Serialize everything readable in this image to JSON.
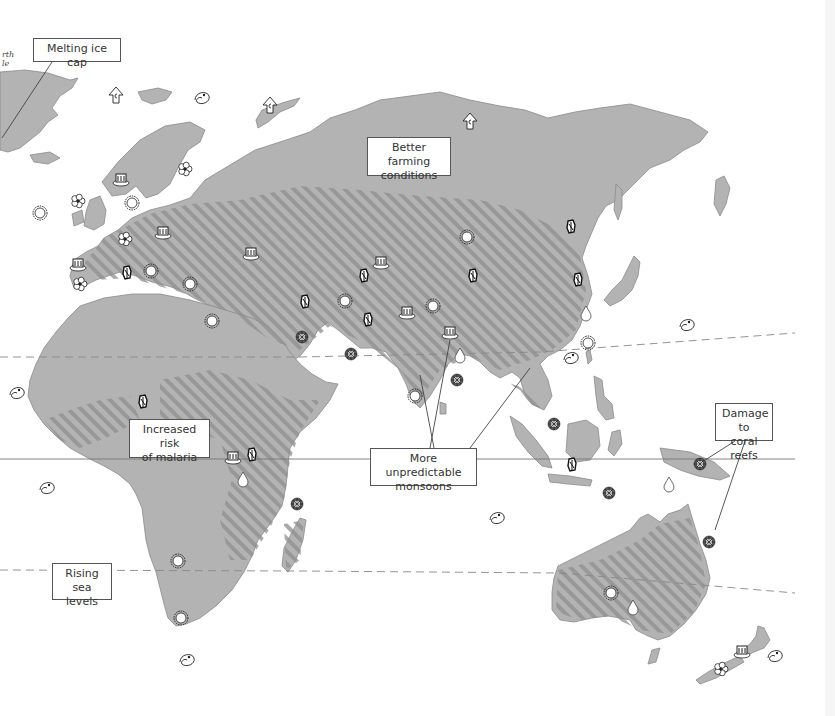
{
  "map": {
    "title": "Climate change impacts - Eastern Hemisphere",
    "colors": {
      "land": "#b3b3b3",
      "land_light": "#c4c4c4",
      "land_stroke": "#8a8a8a",
      "hatch": "#8f8f8f",
      "ocean": "#ffffff",
      "label_border": "#555555",
      "label_text": "#333333",
      "leader_line": "#444444",
      "tropic_line": "#888888",
      "equator_line": "#777777"
    },
    "pole_label": "rth\nle",
    "labels": [
      {
        "id": "melting-ice-cap",
        "text": "Melting ice cap",
        "x": 33,
        "y": 38,
        "w": 88,
        "h": 24
      },
      {
        "id": "better-farming",
        "text": "Better farming\nconditions",
        "x": 367,
        "y": 137,
        "w": 84,
        "h": 39
      },
      {
        "id": "increased-malaria",
        "text": "Increased risk\nof malaria",
        "x": 129,
        "y": 419,
        "w": 81,
        "h": 39
      },
      {
        "id": "unpredictable-monsoons",
        "text": "More unpredictable\nmonsoons",
        "x": 370,
        "y": 448,
        "w": 107,
        "h": 38
      },
      {
        "id": "coral-reef-damage",
        "text": "Damage to\ncoral reefs",
        "x": 715,
        "y": 403,
        "w": 58,
        "h": 38
      },
      {
        "id": "rising-sea-levels",
        "text": "Rising\nsea levels",
        "x": 52,
        "y": 563,
        "w": 60,
        "h": 37
      }
    ],
    "leader_lines": [
      {
        "from": "melting-ice-cap",
        "x1": 52,
        "y1": 62,
        "x2": 2,
        "y2": 138
      },
      {
        "from": "unpredictable-monsoons",
        "x1": 430,
        "y1": 448,
        "x2": 450,
        "y2": 340
      },
      {
        "from": "unpredictable-monsoons",
        "x1": 434,
        "y1": 448,
        "x2": 420,
        "y2": 375
      },
      {
        "from": "unpredictable-monsoons",
        "x1": 470,
        "y1": 448,
        "x2": 530,
        "y2": 368
      },
      {
        "from": "coral-reef-damage",
        "x1": 735,
        "y1": 441,
        "x2": 702,
        "y2": 462
      },
      {
        "from": "coral-reef-damage",
        "x1": 745,
        "y1": 441,
        "x2": 715,
        "y2": 530
      }
    ],
    "reference_lines": [
      {
        "name": "tropic-of-cancer",
        "style": "dashed",
        "points": [
          [
            0,
            357
          ],
          [
            300,
            357
          ],
          [
            540,
            352
          ],
          [
            795,
            333
          ]
        ]
      },
      {
        "name": "equator",
        "style": "solid",
        "points": [
          [
            0,
            459
          ],
          [
            795,
            459
          ]
        ]
      },
      {
        "name": "tropic-of-capricorn",
        "style": "dashed",
        "points": [
          [
            0,
            570
          ],
          [
            300,
            571
          ],
          [
            560,
            573
          ],
          [
            795,
            593
          ]
        ]
      }
    ],
    "legend_icons": {
      "ice": "melting-ice-arrow-icon",
      "storm": "hurricane-swirl-icon",
      "sun": "sun-drought-icon",
      "flower": "flower-farming-icon",
      "mosquito": "mosquito-malaria-icon",
      "rain": "rain-cloud-flood-icon",
      "coral": "coral-reef-icon",
      "water": "water-drop-icon"
    },
    "icons": [
      {
        "type": "ice",
        "x": 116,
        "y": 96
      },
      {
        "type": "ice",
        "x": 270,
        "y": 106
      },
      {
        "type": "ice",
        "x": 470,
        "y": 122
      },
      {
        "type": "storm",
        "x": 203,
        "y": 98
      },
      {
        "type": "storm",
        "x": 18,
        "y": 393
      },
      {
        "type": "storm",
        "x": 48,
        "y": 488
      },
      {
        "type": "storm",
        "x": 688,
        "y": 325
      },
      {
        "type": "storm",
        "x": 572,
        "y": 358
      },
      {
        "type": "storm",
        "x": 498,
        "y": 518
      },
      {
        "type": "storm",
        "x": 188,
        "y": 660
      },
      {
        "type": "storm",
        "x": 776,
        "y": 656
      },
      {
        "type": "sun",
        "x": 132,
        "y": 203
      },
      {
        "type": "sun",
        "x": 40,
        "y": 213
      },
      {
        "type": "sun",
        "x": 151,
        "y": 271
      },
      {
        "type": "sun",
        "x": 190,
        "y": 284
      },
      {
        "type": "sun",
        "x": 212,
        "y": 321
      },
      {
        "type": "sun",
        "x": 467,
        "y": 237
      },
      {
        "type": "sun",
        "x": 345,
        "y": 301
      },
      {
        "type": "sun",
        "x": 433,
        "y": 306
      },
      {
        "type": "sun",
        "x": 415,
        "y": 396
      },
      {
        "type": "sun",
        "x": 588,
        "y": 343
      },
      {
        "type": "sun",
        "x": 178,
        "y": 561
      },
      {
        "type": "sun",
        "x": 181,
        "y": 618
      },
      {
        "type": "sun",
        "x": 611,
        "y": 593
      },
      {
        "type": "flower",
        "x": 78,
        "y": 201
      },
      {
        "type": "flower",
        "x": 185,
        "y": 169
      },
      {
        "type": "flower",
        "x": 125,
        "y": 239
      },
      {
        "type": "flower",
        "x": 80,
        "y": 284
      },
      {
        "type": "flower",
        "x": 721,
        "y": 669
      },
      {
        "type": "mosquito",
        "x": 127,
        "y": 273
      },
      {
        "type": "mosquito",
        "x": 364,
        "y": 276
      },
      {
        "type": "mosquito",
        "x": 305,
        "y": 302
      },
      {
        "type": "mosquito",
        "x": 368,
        "y": 320
      },
      {
        "type": "mosquito",
        "x": 473,
        "y": 276
      },
      {
        "type": "mosquito",
        "x": 571,
        "y": 227
      },
      {
        "type": "mosquito",
        "x": 578,
        "y": 280
      },
      {
        "type": "mosquito",
        "x": 143,
        "y": 402
      },
      {
        "type": "mosquito",
        "x": 252,
        "y": 455
      },
      {
        "type": "mosquito",
        "x": 572,
        "y": 465
      },
      {
        "type": "rain",
        "x": 121,
        "y": 180
      },
      {
        "type": "rain",
        "x": 163,
        "y": 233
      },
      {
        "type": "rain",
        "x": 78,
        "y": 265
      },
      {
        "type": "rain",
        "x": 251,
        "y": 254
      },
      {
        "type": "rain",
        "x": 381,
        "y": 263
      },
      {
        "type": "rain",
        "x": 407,
        "y": 313
      },
      {
        "type": "rain",
        "x": 450,
        "y": 333
      },
      {
        "type": "rain",
        "x": 233,
        "y": 458
      },
      {
        "type": "rain",
        "x": 742,
        "y": 652
      },
      {
        "type": "coral",
        "x": 302,
        "y": 337
      },
      {
        "type": "coral",
        "x": 351,
        "y": 354
      },
      {
        "type": "coral",
        "x": 457,
        "y": 380
      },
      {
        "type": "coral",
        "x": 554,
        "y": 424
      },
      {
        "type": "coral",
        "x": 609,
        "y": 493
      },
      {
        "type": "coral",
        "x": 297,
        "y": 504
      },
      {
        "type": "coral",
        "x": 700,
        "y": 464
      },
      {
        "type": "coral",
        "x": 709,
        "y": 542
      },
      {
        "type": "water",
        "x": 460,
        "y": 355
      },
      {
        "type": "water",
        "x": 243,
        "y": 479
      },
      {
        "type": "water",
        "x": 586,
        "y": 313
      },
      {
        "type": "water",
        "x": 669,
        "y": 484
      },
      {
        "type": "water",
        "x": 633,
        "y": 607
      }
    ]
  }
}
